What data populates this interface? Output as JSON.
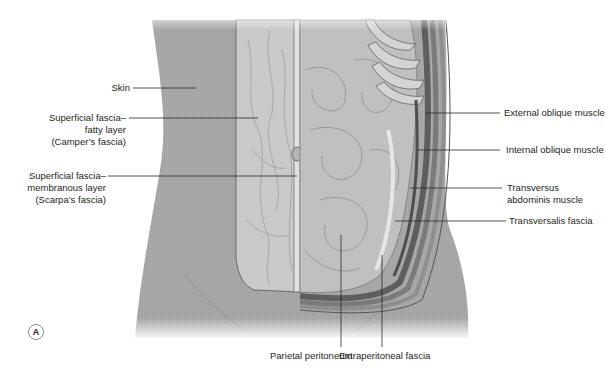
{
  "figure": {
    "panel_label": "A",
    "colors": {
      "skin": "#a9a9a9",
      "fat_layer": "#c6c6c6",
      "intestine": "#bdbdbd",
      "muscle_dark": "#6e6e6e",
      "leader_line": "#2a2a2a",
      "text": "#231f20"
    },
    "labels_left": [
      {
        "id": "skin",
        "lines": [
          "Skin"
        ]
      },
      {
        "id": "campers",
        "lines": [
          "Superficial fascia–",
          "fatty layer",
          "(Camper’s fascia)"
        ]
      },
      {
        "id": "scarpas",
        "lines": [
          "Superficial fascia–",
          "membranous layer",
          "(Scarpa’s fascia)"
        ]
      }
    ],
    "labels_right": [
      {
        "id": "external-oblique",
        "lines": [
          "External oblique muscle"
        ]
      },
      {
        "id": "internal-oblique",
        "lines": [
          "Internal oblique muscle"
        ]
      },
      {
        "id": "transversus",
        "lines": [
          "Transversus",
          "abdominis muscle"
        ]
      },
      {
        "id": "transversalis",
        "lines": [
          "Transversalis fascia"
        ]
      }
    ],
    "labels_bottom": [
      {
        "id": "parietal-peritoneum",
        "lines": [
          "Parietal peritoneum"
        ]
      },
      {
        "id": "extraperitoneal",
        "lines": [
          "Extraperitoneal fascia"
        ]
      }
    ]
  }
}
